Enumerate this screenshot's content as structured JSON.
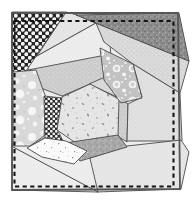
{
  "quilt": {
    "canvas": {
      "width": 192,
      "height": 201,
      "background": "#ffffff"
    },
    "seam_color": "#4a4a4a",
    "outline": {
      "points": "12,13 178,13 180,189 12,190",
      "color": "#555555",
      "width": 1.8
    },
    "stitch": {
      "points": "14.5,21 173.5,21 173.5,186.5 14.5,186.5",
      "color": "#141414",
      "width": 2.1,
      "dash": "4.2 3.4"
    },
    "seams": [
      {
        "x1": 13,
        "y1": 147,
        "x2": 98,
        "y2": 192
      }
    ],
    "patches": [
      {
        "name": "light-wedge-top",
        "points": "66,12 77,15 96,23 37,56",
        "fill": "p-st-light"
      },
      {
        "name": "light-band-upper",
        "points": "96,23 110,44 111,56 28,72 28,60 37,56",
        "fill": "p-st-base"
      },
      {
        "name": "medium-band-above-center",
        "points": "28,70 111,54 117,77 90,84 62,96 30,84",
        "fill": "p-st-med2"
      },
      {
        "name": "light-band-right",
        "points": "96,23 189,61 180,93 133,64 104,42",
        "fill": "p-st-med"
      },
      {
        "name": "medium-wedge-center-right",
        "points": "89,84 112,74 120,99 117,97",
        "fill": "p-st-med"
      },
      {
        "name": "medium-strip-right-of-center",
        "points": "116,96 128,104 127,142 111,132",
        "fill": "p-st-med2"
      },
      {
        "name": "light-patch-right-middle",
        "points": "133,64 180,93 182,141 127,141 128,104 142,97",
        "fill": "p-st-light2"
      },
      {
        "name": "light-patch-bottom-right",
        "points": "78,162 127,146 181,140 189,152 181,189 97,192",
        "fill": "p-st-light"
      },
      {
        "name": "light-patch-bottom-left",
        "points": "12,144 34,144 44,138 64,141 88,150 98,192 12,190",
        "fill": "p-st-base"
      },
      {
        "name": "dark-speckled-patch-top-right",
        "points": "76,15 179,13 189,61",
        "fill": "p-speckle-dark"
      },
      {
        "name": "polka-dot-patch-top-left",
        "points": "12,12 66,12 24,74 12,79",
        "fill": "p-polka-big"
      },
      {
        "name": "floral-patch-left",
        "points": "13,72 36,70 46,98 44,136 30,146 13,146",
        "fill": "p-floral"
      },
      {
        "name": "polka-dot-patch-center-left",
        "points": "44,96 62,98 58,131 63,141 45,139",
        "fill": "p-polka-small"
      },
      {
        "name": "confetti-patch-center",
        "points": "90,84 62,97 57,130 83,148 118,136 119,99",
        "fill": "p-confetti"
      },
      {
        "name": "ring-print-patch-upper-right",
        "points": "100,48 133,64 142,98 121,103 104,80",
        "fill": "p-rings"
      },
      {
        "name": "dark-strip-bottom-center",
        "points": "65,143 118,135 127,147 80,161",
        "fill": "p-speckle-med"
      },
      {
        "name": "calico-patch-bottom-center",
        "points": "27,148 45,138 66,141 87,151 74,164 42,157",
        "fill": "p-calico"
      }
    ]
  }
}
